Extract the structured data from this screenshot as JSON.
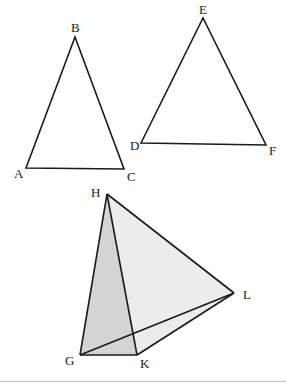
{
  "diagram": {
    "triangle_abc": {
      "labels": {
        "A": "A",
        "B": "B",
        "C": "C"
      },
      "points": {
        "A": [
          26,
          168
        ],
        "B": [
          75,
          37
        ],
        "C": [
          124,
          169
        ]
      }
    },
    "triangle_def": {
      "labels": {
        "D": "D",
        "E": "E",
        "F": "F"
      },
      "points": {
        "D": [
          141,
          143
        ],
        "E": [
          203,
          18
        ],
        "F": [
          266,
          145
        ]
      }
    },
    "tetrahedron_ghkl": {
      "labels": {
        "G": "G",
        "H": "H",
        "K": "K",
        "L": "L"
      },
      "points": {
        "G": [
          80,
          355
        ],
        "H": [
          107,
          194
        ],
        "K": [
          137,
          355
        ],
        "L": [
          234,
          293
        ]
      },
      "face_colors": {
        "front_face_ghk": "#d4d4d4",
        "side_face_hkl": "#ececec"
      }
    },
    "footer_rule_color": "#bdbdbd"
  }
}
